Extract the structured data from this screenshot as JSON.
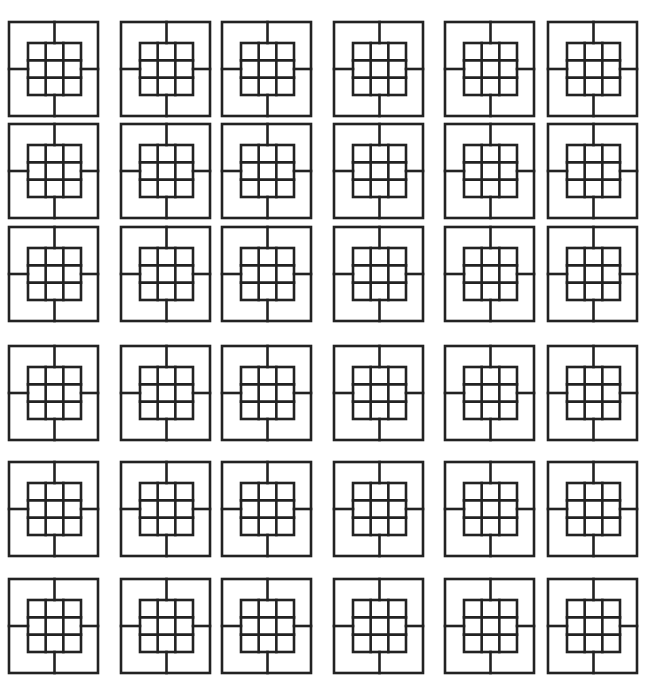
{
  "canvas": {
    "width": 647,
    "height": 682,
    "background": "#ffffff"
  },
  "style": {
    "stroke": "#222222",
    "stroke_width": 2.6
  },
  "grid": {
    "columns": 6,
    "rows": 6,
    "column_x": [
      9,
      121,
      222,
      334,
      445,
      548
    ],
    "row_y": [
      22,
      124,
      227,
      346,
      462,
      579
    ],
    "tile_width": 89,
    "tile_height": 94
  },
  "tile": {
    "description": "Square frame with a centered 3x3 inner grid; four connector lines join the inner grid to the midpoints of each side of the outer frame",
    "inner_grid": {
      "rows": 3,
      "cols": 3,
      "offset_x": 19,
      "offset_y": 21,
      "size_w": 53,
      "size_h": 52
    },
    "connectors": [
      "top",
      "bottom",
      "left",
      "right"
    ]
  },
  "tiles_count": 36
}
